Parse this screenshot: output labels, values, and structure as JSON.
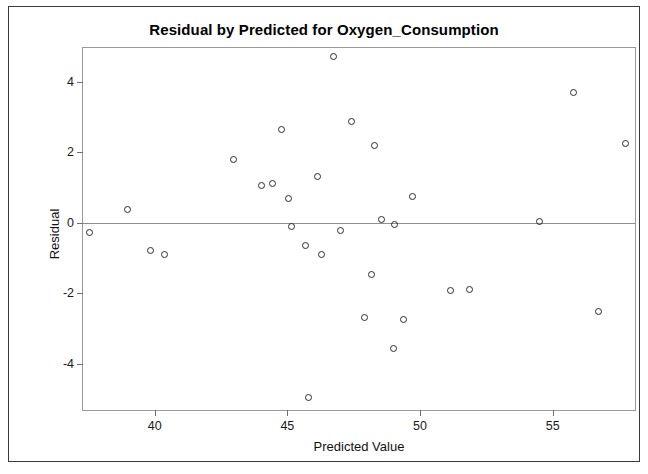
{
  "chart_data": {
    "type": "scatter",
    "title": "Residual by Predicted for Oxygen_Consumption",
    "xlabel": "Predicted Value",
    "ylabel": "Residual",
    "xlim": [
      37.3,
      58.1
    ],
    "ylim": [
      -5.3,
      4.95
    ],
    "xticks": [
      40,
      45,
      50,
      55
    ],
    "xtick_labels": [
      "40",
      "45",
      "50",
      "55"
    ],
    "yticks": [
      4,
      2,
      0,
      -2,
      -4
    ],
    "ytick_labels": [
      "4",
      "2",
      "0",
      "-2",
      "-4"
    ],
    "grid": false,
    "legend": null,
    "reference_lines": [
      {
        "name": "zero-residual-line",
        "orientation": "horizontal",
        "y": 0,
        "color": "#8f8f8f"
      }
    ],
    "marker": {
      "shape": "open-circle",
      "color": "#2b2b37",
      "size": 7
    },
    "points": [
      {
        "x": 37.55,
        "y": -0.28
      },
      {
        "x": 38.98,
        "y": 0.37
      },
      {
        "x": 39.84,
        "y": -0.77
      },
      {
        "x": 40.36,
        "y": -0.9
      },
      {
        "x": 42.97,
        "y": 1.8
      },
      {
        "x": 44.04,
        "y": 1.05
      },
      {
        "x": 44.45,
        "y": 1.12
      },
      {
        "x": 45.05,
        "y": 0.7
      },
      {
        "x": 44.78,
        "y": 2.65
      },
      {
        "x": 45.15,
        "y": -0.1
      },
      {
        "x": 45.68,
        "y": -0.63
      },
      {
        "x": 46.13,
        "y": 1.3
      },
      {
        "x": 45.8,
        "y": -4.95
      },
      {
        "x": 46.74,
        "y": 4.7
      },
      {
        "x": 47.41,
        "y": 2.87
      },
      {
        "x": 47.0,
        "y": -0.22
      },
      {
        "x": 46.27,
        "y": -0.9
      },
      {
        "x": 48.28,
        "y": 2.2
      },
      {
        "x": 49.7,
        "y": 0.75
      },
      {
        "x": 48.56,
        "y": 0.08
      },
      {
        "x": 49.05,
        "y": -0.05
      },
      {
        "x": 48.16,
        "y": -1.45
      },
      {
        "x": 47.9,
        "y": -2.67
      },
      {
        "x": 49.36,
        "y": -2.75
      },
      {
        "x": 48.99,
        "y": -3.55
      },
      {
        "x": 51.13,
        "y": -1.93
      },
      {
        "x": 51.85,
        "y": -1.9
      },
      {
        "x": 54.5,
        "y": 0.03
      },
      {
        "x": 55.77,
        "y": 3.7
      },
      {
        "x": 57.74,
        "y": 2.25
      },
      {
        "x": 56.74,
        "y": -2.5
      }
    ]
  }
}
